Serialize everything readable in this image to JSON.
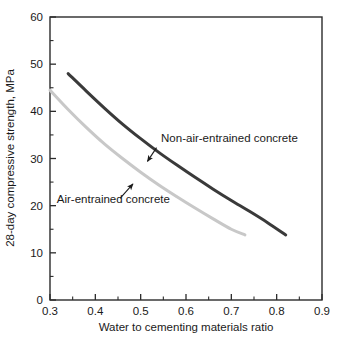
{
  "chart_data": {
    "type": "line",
    "title": "",
    "xlabel": "Water to cementing materials ratio",
    "ylabel": "28-day compressive strength, MPa",
    "xlim": [
      0.3,
      0.9
    ],
    "ylim": [
      0,
      60
    ],
    "grid": false,
    "legend_position": "inline-annotations",
    "x_ticks": [
      "0.3",
      "0.4",
      "0.5",
      "0.6",
      "0.7",
      "0.8",
      "0.9"
    ],
    "x_tick_values": [
      0.3,
      0.4,
      0.5,
      0.6,
      0.7,
      0.8,
      0.9
    ],
    "x_minor_tick_values": [
      0.35,
      0.45,
      0.55,
      0.65,
      0.75,
      0.85
    ],
    "y_ticks": [
      "0",
      "10",
      "20",
      "30",
      "40",
      "50",
      "60"
    ],
    "y_tick_values": [
      0,
      10,
      20,
      30,
      40,
      50,
      60
    ],
    "y_minor_tick_values": [
      5,
      15,
      25,
      35,
      45,
      55
    ],
    "series": [
      {
        "name": "Non-air-entrained concrete",
        "color": "#3a3a3a",
        "x": [
          0.34,
          0.38,
          0.42,
          0.46,
          0.5,
          0.54,
          0.58,
          0.62,
          0.66,
          0.7,
          0.74,
          0.78,
          0.82
        ],
        "values": [
          48.0,
          44.3,
          40.7,
          37.3,
          34.2,
          31.3,
          28.6,
          26.0,
          23.5,
          21.1,
          18.8,
          16.4,
          13.8
        ]
      },
      {
        "name": "Air-entrained concrete",
        "color": "#c8c8c8",
        "x": [
          0.3,
          0.34,
          0.38,
          0.42,
          0.46,
          0.5,
          0.54,
          0.58,
          0.62,
          0.66,
          0.7,
          0.73
        ],
        "values": [
          44.5,
          40.4,
          36.6,
          33.1,
          30.0,
          27.1,
          24.4,
          21.9,
          19.5,
          17.2,
          15.0,
          13.8
        ]
      }
    ],
    "annotations": [
      {
        "text": "Non-air-entrained concrete",
        "text_x": 0.545,
        "text_y": 33.5,
        "arrow_from_x": 0.535,
        "arrow_from_y": 32.3,
        "arrow_to_x": 0.515,
        "arrow_to_y": 29.4
      },
      {
        "text": "Air-entrained concrete",
        "text_x": 0.315,
        "text_y": 20.6,
        "arrow_from_x": 0.455,
        "arrow_from_y": 21.6,
        "arrow_to_x": 0.483,
        "arrow_to_y": 24.6
      }
    ]
  }
}
